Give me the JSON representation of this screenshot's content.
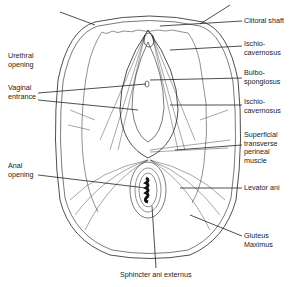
{
  "diagram": {
    "type": "anatomical-line-drawing",
    "labels_left": [
      {
        "id": "urethral",
        "line1": "Urethral",
        "line2": "opening"
      },
      {
        "id": "vaginal",
        "line1": "Vaginal",
        "line2": "entrance"
      },
      {
        "id": "anal",
        "line1": "Anal",
        "line2": "opening"
      }
    ],
    "labels_right": [
      {
        "id": "clitoral",
        "line1": "Clitoral shaft",
        "line2": ""
      },
      {
        "id": "ischio1",
        "line1": "Ischio-",
        "line2": "cavernosus"
      },
      {
        "id": "bulbo",
        "line1": "Bulbo-",
        "line2": "spongiosus"
      },
      {
        "id": "ischio2",
        "line1": "Ischio-",
        "line2": "cavernosus"
      },
      {
        "id": "superficial",
        "line1": "Superficial",
        "line2": "transverse",
        "line3": "perineal",
        "line4": "muscle"
      },
      {
        "id": "levator",
        "line1": "Levator ani",
        "line2": ""
      },
      {
        "id": "gluteus",
        "line1": "Gluteus",
        "line2": "Maximus"
      }
    ],
    "label_bottom": {
      "id": "sphincter",
      "text": "Sphincter ani externus"
    },
    "colors": {
      "line": "#222222",
      "background": "#ffffff"
    }
  }
}
